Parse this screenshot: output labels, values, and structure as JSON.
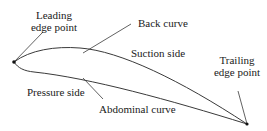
{
  "figure": {
    "type": "airfoil-blade-profile",
    "stroke_color": "#3a3a3a",
    "point_color": "#111111",
    "labels": {
      "leading_edge_line1": "Leading",
      "leading_edge_line2": "edge point",
      "back_curve": "Back curve",
      "suction_side": "Suction side",
      "trailing_edge_line1": "Trailing",
      "trailing_edge_line2": "edge point",
      "pressure_side": "Pressure side",
      "abdominal_curve": "Abdominal curve"
    },
    "points": {
      "leading_edge": [
        14,
        62
      ],
      "trailing_edge": [
        247,
        124
      ]
    }
  }
}
